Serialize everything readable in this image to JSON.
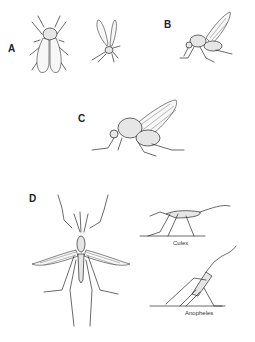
{
  "figure": {
    "panels": [
      {
        "id": "A",
        "label": "A",
        "description": "Two small flies: dorsal view with folded wings and a flying midge"
      },
      {
        "id": "B",
        "label": "B",
        "description": "Small fly in side view with raised wing"
      },
      {
        "id": "C",
        "label": "C",
        "description": "Larger fly in side view with raised wings"
      },
      {
        "id": "D",
        "label": "D",
        "description": "Mosquito dorsal view with outstretched wings and resting postures"
      }
    ],
    "captions": {
      "culex": "Culex",
      "anopheles": "Anopheles"
    },
    "colors": {
      "ink": "#2a2a2a",
      "background": "#ffffff"
    }
  }
}
